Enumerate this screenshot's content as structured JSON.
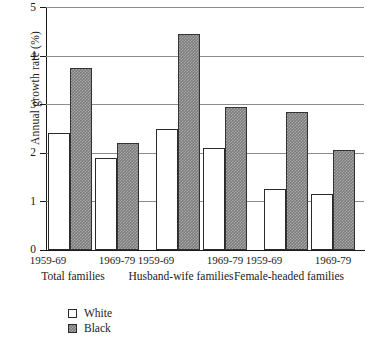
{
  "chart_data": {
    "type": "bar",
    "title": "",
    "xlabel": "",
    "ylabel": "Annual growth rate (%)",
    "ylim": [
      0,
      5
    ],
    "yticks": [
      0,
      1,
      2,
      3,
      4,
      5
    ],
    "ytick_labels": [
      "0",
      "1",
      "2",
      "3",
      "4",
      "5"
    ],
    "grid": true,
    "legend_position": "bottom-left",
    "groups": [
      {
        "label": "Total families",
        "periods": [
          "1959-69",
          "1969-79"
        ]
      },
      {
        "label": "Husband-wife families",
        "periods": [
          "1959-69",
          "1969-79"
        ]
      },
      {
        "label": "Female-headed families",
        "periods": [
          "1959-69",
          "1969-79"
        ]
      }
    ],
    "categories": [
      "Total families 1959-69",
      "Total families 1969-79",
      "Husband-wife families 1959-69",
      "Husband-wife families 1969-79",
      "Female-headed families 1959-69",
      "Female-headed families 1969-79"
    ],
    "series": [
      {
        "name": "White",
        "fill": "hollow",
        "values": [
          2.4,
          1.9,
          2.5,
          2.1,
          1.25,
          1.15
        ]
      },
      {
        "name": "Black",
        "fill": "gray-hatch",
        "values": [
          3.75,
          2.2,
          4.45,
          2.95,
          2.85,
          2.05
        ]
      }
    ]
  },
  "legend": {
    "items": [
      {
        "label": "White",
        "swatch": "hollow-square"
      },
      {
        "label": "Black",
        "swatch": "gray-hatched-square"
      }
    ]
  },
  "colors": {
    "white_bar": "#ffffff",
    "black_bar": "#7d7d7d",
    "bar_outline": "#2b2b2b",
    "gridline": "#8c8c8c",
    "axis": "#1a1a1a",
    "background": "#ffffff",
    "text": "#1a1a1a"
  }
}
